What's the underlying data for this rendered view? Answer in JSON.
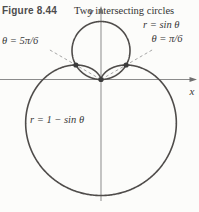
{
  "figure": {
    "number": "Figure 8.44",
    "caption": "Two intersecting circles"
  },
  "plot": {
    "y_axis_label": "y",
    "x_axis_label": "x",
    "curve_labels": {
      "circle": "r = sin θ",
      "cardioid": "r = 1 − sin θ"
    },
    "angle_labels": {
      "left": "θ = 5π/6",
      "right": "θ = π/6"
    }
  },
  "colors": {
    "curve": "#4f4c4a",
    "axis": "#8b8b8b",
    "dashed_ray": "#9c9c9c",
    "point": "#3c3c3c",
    "text": "#383838",
    "background": "#fcfcfa"
  },
  "chart_data": {
    "type": "line",
    "subtype": "polar",
    "title": "Two intersecting circles",
    "curves": [
      {
        "id": "sin",
        "equation": "r = sin θ",
        "theta_domain_deg": [
          0,
          180
        ]
      },
      {
        "id": "one-minus-sin",
        "equation": "r = 1 − sin θ",
        "theta_domain_deg": [
          0,
          360
        ]
      }
    ],
    "intersection_rays": [
      {
        "label": "θ = 5π/6",
        "theta_deg": 150
      },
      {
        "label": "θ = π/6",
        "theta_deg": 30
      }
    ],
    "marked_points": [
      {
        "desc": "intersection at θ = 5π/6",
        "r": 0.5,
        "theta_deg": 150
      },
      {
        "desc": "intersection at θ = π/6",
        "r": 0.5,
        "theta_deg": 30
      },
      {
        "desc": "pole (origin)",
        "r": 0,
        "theta_deg": 0
      }
    ],
    "axes": {
      "grid": false,
      "x_units_visible": [
        -1.75,
        1.65
      ],
      "y_units_visible": [
        -2.1,
        1.25
      ]
    }
  }
}
